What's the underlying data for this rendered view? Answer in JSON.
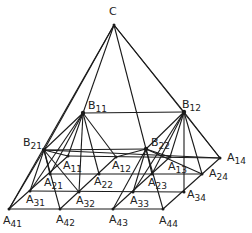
{
  "diagram": {
    "type": "hierarchical pyramid",
    "stroke_color": "#1a1a1a",
    "label_color": "#222222",
    "nodes": {
      "C": {
        "label": "C",
        "sub": "",
        "x": 114,
        "y": 25,
        "lx": 109,
        "ly": 15,
        "level": "apex"
      },
      "B11": {
        "label": "B",
        "sub": "11",
        "x": 83,
        "y": 113,
        "lx": 88,
        "ly": 109,
        "level": "B"
      },
      "B12": {
        "label": "B",
        "sub": "12",
        "x": 184,
        "y": 112,
        "lx": 182,
        "ly": 108,
        "level": "B"
      },
      "B21": {
        "label": "B",
        "sub": "21",
        "x": 44,
        "y": 150,
        "lx": 23,
        "ly": 146,
        "level": "B"
      },
      "B22": {
        "label": "B",
        "sub": "22",
        "x": 146,
        "y": 149,
        "lx": 151,
        "ly": 146,
        "level": "B"
      },
      "A11": {
        "label": "A",
        "sub": "11",
        "x": 68,
        "y": 156,
        "lx": 63,
        "ly": 169,
        "level": "A"
      },
      "A12": {
        "label": "A",
        "sub": "12",
        "x": 116,
        "y": 157,
        "lx": 112,
        "ly": 169,
        "level": "A"
      },
      "A13": {
        "label": "A",
        "sub": "13",
        "x": 170,
        "y": 157,
        "lx": 168,
        "ly": 170,
        "level": "A"
      },
      "A14": {
        "label": "A",
        "sub": "14",
        "x": 220,
        "y": 158,
        "lx": 227,
        "ly": 161,
        "level": "A"
      },
      "A21": {
        "label": "A",
        "sub": "21",
        "x": 50,
        "y": 174,
        "lx": 44,
        "ly": 186,
        "level": "A"
      },
      "A22": {
        "label": "A",
        "sub": "22",
        "x": 99,
        "y": 174,
        "lx": 94,
        "ly": 185,
        "level": "A"
      },
      "A23": {
        "label": "A",
        "sub": "23",
        "x": 152,
        "y": 174,
        "lx": 148,
        "ly": 186,
        "level": "A"
      },
      "A24": {
        "label": "A",
        "sub": "24",
        "x": 202,
        "y": 174,
        "lx": 209,
        "ly": 177,
        "level": "A"
      },
      "A31": {
        "label": "A",
        "sub": "31",
        "x": 30,
        "y": 191,
        "lx": 26,
        "ly": 203,
        "level": "A"
      },
      "A32": {
        "label": "A",
        "sub": "32",
        "x": 79,
        "y": 192,
        "lx": 76,
        "ly": 204,
        "level": "A"
      },
      "A33": {
        "label": "A",
        "sub": "33",
        "x": 133,
        "y": 192,
        "lx": 130,
        "ly": 204,
        "level": "A"
      },
      "A34": {
        "label": "A",
        "sub": "34",
        "x": 184,
        "y": 192,
        "lx": 187,
        "ly": 198,
        "level": "A"
      },
      "A41": {
        "label": "A",
        "sub": "41",
        "x": 9,
        "y": 209,
        "lx": 3,
        "ly": 224,
        "level": "A"
      },
      "A42": {
        "label": "A",
        "sub": "42",
        "x": 60,
        "y": 209,
        "lx": 56,
        "ly": 223,
        "level": "A"
      },
      "A43": {
        "label": "A",
        "sub": "43",
        "x": 113,
        "y": 209,
        "lx": 109,
        "ly": 223,
        "level": "A"
      },
      "A44": {
        "label": "A",
        "sub": "44",
        "x": 163,
        "y": 209,
        "lx": 159,
        "ly": 224,
        "level": "A"
      }
    },
    "edges": [
      [
        "C",
        "B11"
      ],
      [
        "C",
        "B12"
      ],
      [
        "C",
        "B21"
      ],
      [
        "C",
        "B22"
      ],
      [
        "C",
        "A41"
      ],
      [
        "C",
        "A14"
      ],
      [
        "B11",
        "B12"
      ],
      [
        "B21",
        "B22"
      ],
      [
        "B11",
        "B21"
      ],
      [
        "B12",
        "B22"
      ],
      [
        "B11",
        "A11"
      ],
      [
        "B11",
        "A12"
      ],
      [
        "B11",
        "A21"
      ],
      [
        "B11",
        "A22"
      ],
      [
        "B11",
        "A31"
      ],
      [
        "B11",
        "A32"
      ],
      [
        "B12",
        "A13"
      ],
      [
        "B12",
        "A14"
      ],
      [
        "B12",
        "A23"
      ],
      [
        "B12",
        "A24"
      ],
      [
        "B12",
        "A33"
      ],
      [
        "B12",
        "A34"
      ],
      [
        "B21",
        "A11"
      ],
      [
        "B21",
        "A21"
      ],
      [
        "B21",
        "A31"
      ],
      [
        "B21",
        "A41"
      ],
      [
        "B21",
        "A32"
      ],
      [
        "B21",
        "A42"
      ],
      [
        "B22",
        "A12"
      ],
      [
        "B22",
        "A13"
      ],
      [
        "B22",
        "A23"
      ],
      [
        "B22",
        "A33"
      ],
      [
        "B22",
        "A43"
      ],
      [
        "B22",
        "A44"
      ],
      [
        "B21",
        "A14"
      ],
      [
        "B22",
        "A24"
      ],
      [
        "A11",
        "A14"
      ],
      [
        "A21",
        "A24"
      ],
      [
        "A31",
        "A34"
      ],
      [
        "A41",
        "A44"
      ],
      [
        "A11",
        "A41"
      ],
      [
        "A12",
        "A42"
      ],
      [
        "A13",
        "A43"
      ],
      [
        "A14",
        "A44"
      ]
    ]
  }
}
